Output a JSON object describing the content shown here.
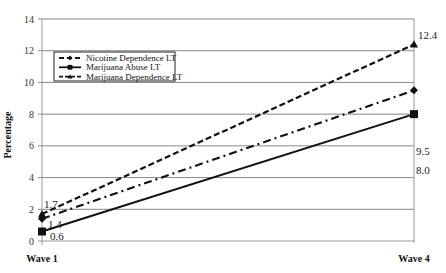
{
  "chart_data": {
    "type": "line",
    "title": "",
    "xlabel": "",
    "ylabel": "Percentage",
    "categories": [
      "Wave 1",
      "Wave 4"
    ],
    "ylim": [
      0,
      14
    ],
    "yticks": [
      0,
      2,
      4,
      6,
      8,
      10,
      12,
      14
    ],
    "grid": true,
    "legend_position": "upper-left-inside",
    "series": [
      {
        "name": "Nicotine Dependence LT",
        "values": [
          1.4,
          9.5
        ],
        "labels": [
          "1.4",
          "9.5"
        ],
        "style": "dash-dot",
        "marker": "diamond"
      },
      {
        "name": "Marijuana Abuse LT",
        "values": [
          0.6,
          8.0
        ],
        "labels": [
          "0.6",
          "8.0"
        ],
        "style": "solid",
        "marker": "square"
      },
      {
        "name": "Marijuana Dependence LT",
        "values": [
          1.7,
          12.4
        ],
        "labels": [
          "1.7",
          "12.4"
        ],
        "style": "dashed",
        "marker": "triangle"
      }
    ]
  },
  "colors": {
    "line": "#111111",
    "grid": "#888888",
    "axis": "#999999"
  }
}
